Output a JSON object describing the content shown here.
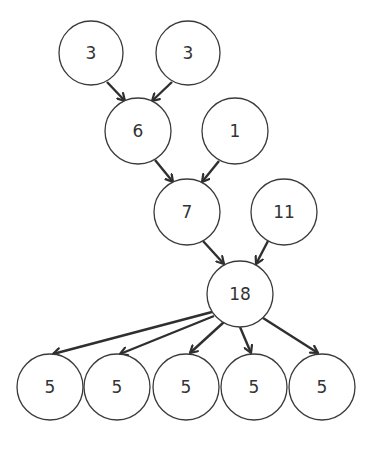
{
  "diagram": {
    "type": "tree",
    "colors": {
      "background": "#ffffff",
      "node_stroke": "#3a3a3a",
      "node_fill": "#ffffff",
      "edge": "#2f2f2f",
      "text": "#333333"
    },
    "nodes": [
      {
        "id": "n3a",
        "label": "3",
        "cx": 91,
        "cy": 53,
        "r": 32
      },
      {
        "id": "n3b",
        "label": "3",
        "cx": 188,
        "cy": 53,
        "r": 32
      },
      {
        "id": "n6",
        "label": "6",
        "cx": 138,
        "cy": 131,
        "r": 33
      },
      {
        "id": "n1",
        "label": "1",
        "cx": 235,
        "cy": 131,
        "r": 33
      },
      {
        "id": "n7",
        "label": "7",
        "cx": 187,
        "cy": 212,
        "r": 33
      },
      {
        "id": "n11",
        "label": "11",
        "cx": 284,
        "cy": 212,
        "r": 33
      },
      {
        "id": "n18",
        "label": "18",
        "cx": 240,
        "cy": 294,
        "r": 33
      },
      {
        "id": "n5a",
        "label": "5",
        "cx": 50,
        "cy": 387,
        "r": 33
      },
      {
        "id": "n5b",
        "label": "5",
        "cx": 117,
        "cy": 387,
        "r": 33
      },
      {
        "id": "n5c",
        "label": "5",
        "cx": 186,
        "cy": 387,
        "r": 33
      },
      {
        "id": "n5d",
        "label": "5",
        "cx": 254,
        "cy": 387,
        "r": 33
      },
      {
        "id": "n5e",
        "label": "5",
        "cx": 322,
        "cy": 387,
        "r": 33
      }
    ],
    "edges": [
      {
        "from": "n3a",
        "to": "n6",
        "x1": 107,
        "y1": 82,
        "x2": 125,
        "y2": 101
      },
      {
        "from": "n3b",
        "to": "n6",
        "x1": 172,
        "y1": 82,
        "x2": 152,
        "y2": 101
      },
      {
        "from": "n6",
        "to": "n7",
        "x1": 155,
        "y1": 160,
        "x2": 173,
        "y2": 182
      },
      {
        "from": "n1",
        "to": "n7",
        "x1": 219,
        "y1": 161,
        "x2": 202,
        "y2": 182
      },
      {
        "from": "n7",
        "to": "n18",
        "x1": 203,
        "y1": 241,
        "x2": 224,
        "y2": 264
      },
      {
        "from": "n11",
        "to": "n18",
        "x1": 268,
        "y1": 241,
        "x2": 256,
        "y2": 264
      },
      {
        "from": "n18",
        "to": "n5a",
        "x1": 212,
        "y1": 312,
        "x2": 53,
        "y2": 354
      },
      {
        "from": "n18",
        "to": "n5b",
        "x1": 214,
        "y1": 316,
        "x2": 120,
        "y2": 354
      },
      {
        "from": "n18",
        "to": "n5c",
        "x1": 224,
        "y1": 322,
        "x2": 190,
        "y2": 353
      },
      {
        "from": "n18",
        "to": "n5d",
        "x1": 240,
        "y1": 327,
        "x2": 251,
        "y2": 353
      },
      {
        "from": "n18",
        "to": "n5e",
        "x1": 263,
        "y1": 318,
        "x2": 318,
        "y2": 353
      }
    ]
  }
}
